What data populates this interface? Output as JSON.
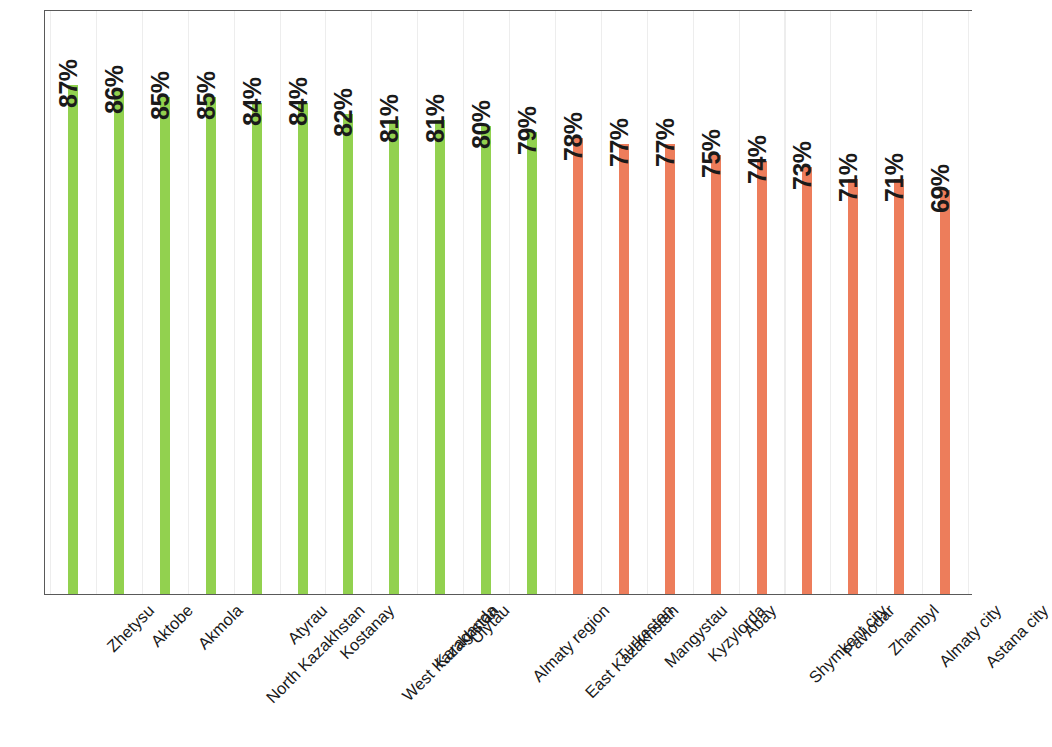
{
  "chart": {
    "type": "bar",
    "colors": {
      "green": "#92d14f",
      "orange": "#ed7d5b",
      "border": "#595959",
      "gridline": "#ededed"
    }
  },
  "chart_data": {
    "type": "bar",
    "title": "",
    "subtitle": "",
    "xlabel": "",
    "ylabel": "",
    "ylim": [
      0,
      100
    ],
    "grid": "vertical",
    "legend": "none",
    "categories": [
      "Zhetysu",
      "Aktobe",
      "Akmola",
      "North Kazakhstan",
      "Atyrau",
      "Kostanay",
      "West Kazakhstan",
      "Karaganda",
      "Ulytau",
      "Almaty region",
      "East Kazakhstan",
      "Turkestan",
      "Mangystau",
      "Kyzylorda",
      "Abay",
      "Shymkent city",
      "Pavlodar",
      "Zhambyl",
      "Almaty city",
      "Astana city"
    ],
    "values": [
      87,
      86,
      85,
      85,
      84,
      84,
      82,
      81,
      81,
      80,
      79,
      78,
      77,
      77,
      75,
      74,
      73,
      71,
      71,
      69
    ],
    "data_labels": [
      "87%",
      "86%",
      "85%",
      "85%",
      "84%",
      "84%",
      "82%",
      "81%",
      "81%",
      "80%",
      "79%",
      "78%",
      "77%",
      "77%",
      "75%",
      "74%",
      "73%",
      "71%",
      "71%",
      "69%"
    ],
    "bar_colors": [
      "green",
      "green",
      "green",
      "green",
      "green",
      "green",
      "green",
      "green",
      "green",
      "green",
      "green",
      "orange",
      "orange",
      "orange",
      "orange",
      "orange",
      "orange",
      "orange",
      "orange",
      "orange"
    ]
  }
}
